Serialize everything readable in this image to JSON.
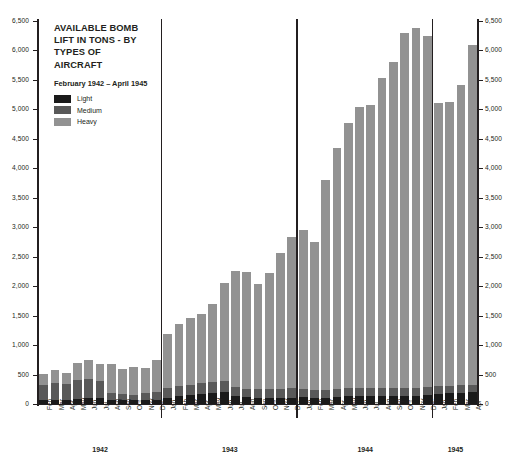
{
  "chart_data": {
    "type": "bar",
    "subtype": "stacked-bar",
    "title": "AVAILABLE BOMB LIFT IN TONS - BY TYPES OF AIRCRAFT",
    "subtitle": "February 1942 – April 1945",
    "xlabel": "",
    "ylabel": "",
    "ylim": [
      0,
      6500
    ],
    "ytick_step": 500,
    "yticks": [
      "0",
      "500",
      "1,000",
      "1,500",
      "2,000",
      "2,500",
      "3,000",
      "3,500",
      "4,000",
      "4,500",
      "5,000",
      "5,500",
      "6,000",
      "6,500"
    ],
    "ytick_values": [
      0,
      500,
      1000,
      1500,
      2000,
      2500,
      3000,
      3500,
      4000,
      4500,
      5000,
      5500,
      6000,
      6500
    ],
    "grid": false,
    "dual_axis": true,
    "legend_position": "top-left inside",
    "legend": [
      {
        "name": "Light",
        "color": "#1a1a1a"
      },
      {
        "name": "Medium",
        "color": "#595959"
      },
      {
        "name": "Heavy",
        "color": "#929292"
      }
    ],
    "series": [
      {
        "name": "Light",
        "color": "#1a1a1a",
        "values": [
          60,
          70,
          70,
          90,
          100,
          95,
          70,
          60,
          60,
          60,
          70,
          110,
          130,
          150,
          170,
          190,
          200,
          140,
          120,
          110,
          110,
          110,
          110,
          120,
          110,
          110,
          120,
          130,
          130,
          130,
          130,
          130,
          130,
          140,
          150,
          170,
          180,
          190,
          200
        ]
      },
      {
        "name": "Medium",
        "color": "#595959",
        "values": [
          260,
          280,
          270,
          310,
          330,
          300,
          120,
          110,
          100,
          130,
          130,
          160,
          170,
          170,
          180,
          190,
          190,
          150,
          140,
          140,
          150,
          150,
          160,
          140,
          130,
          130,
          130,
          140,
          140,
          140,
          140,
          140,
          140,
          140,
          140,
          130,
          130,
          130,
          130
        ]
      },
      {
        "name": "Heavy",
        "color": "#929292",
        "values": [
          190,
          230,
          180,
          300,
          320,
          285,
          490,
          430,
          460,
          420,
          540,
          910,
          1050,
          1140,
          1180,
          1310,
          1670,
          1960,
          1980,
          1790,
          1960,
          2310,
          2570,
          2690,
          2510,
          3560,
          4100,
          4500,
          4770,
          4800,
          5270,
          5540,
          6030,
          6100,
          5960,
          4810,
          4810,
          5100,
          5770
        ]
      }
    ],
    "totals": [
      510,
      580,
      520,
      700,
      750,
      680,
      680,
      600,
      620,
      610,
      740,
      1180,
      1350,
      1460,
      1530,
      1690,
      2060,
      2250,
      2240,
      2040,
      2220,
      2570,
      2840,
      2950,
      2750,
      3800,
      4350,
      4770,
      5040,
      5070,
      5540,
      5810,
      6300,
      6380,
      6250,
      5110,
      5120,
      5420,
      6100
    ],
    "x": [
      "Feb",
      "Mar",
      "Apr",
      "May",
      "Jun",
      "Jul",
      "Aug",
      "Sep",
      "Oct",
      "Nov",
      "Dec",
      "Jan",
      "Feb",
      "Mar",
      "Apr",
      "May",
      "Jun",
      "Jul",
      "Aug",
      "Sep",
      "Oct",
      "Nov",
      "Dec",
      "Jan",
      "Feb",
      "Mar",
      "Apr",
      "May",
      "Jun",
      "Jul",
      "Aug",
      "Sep",
      "Oct",
      "Nov",
      "Dec",
      "Jan",
      "Feb",
      "Mar",
      "Apr"
    ],
    "year_groups": [
      {
        "label": "1942",
        "count": 11
      },
      {
        "label": "1943",
        "count": 12
      },
      {
        "label": "1944",
        "count": 12
      },
      {
        "label": "1945",
        "count": 4
      }
    ]
  }
}
